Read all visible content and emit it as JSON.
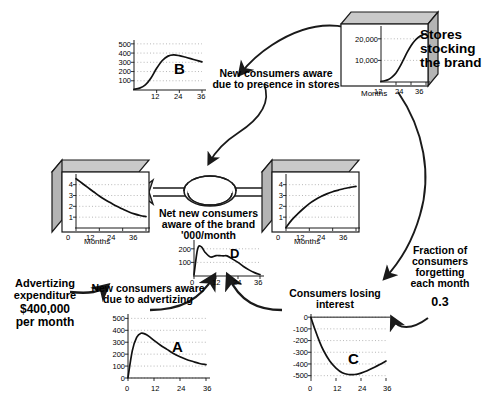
{
  "diagram": {
    "labels": {
      "stores_stocking": "Stores\nstocking\nthe brand",
      "new_aware_stores": "New consumers aware\ndue to presence in stores",
      "net_new_consumers": "Net new consumers\naware of the brand\n'000/month",
      "new_aware_advertizing": "New consumers aware\ndue to advertizing",
      "consumers_losing_interest": "Consumers losing\ninterest",
      "advertizing_expenditure": "Advertizing\nexpenditure",
      "advertizing_amount": "$400,000\nper month",
      "forgetting_fraction": "Fraction of\nconsumers\nforgetting\neach month",
      "forgetting_value": "0.3"
    },
    "chart_letters": {
      "a": "A",
      "b": "B",
      "c": "C",
      "d": "D"
    },
    "axis_title": "Months"
  },
  "chart_data": [
    {
      "id": "stores",
      "type": "line",
      "title": "Stores stocking the brand",
      "xlabel": "Months",
      "ylabel": "",
      "xticks": [
        12,
        24,
        36
      ],
      "yticks": [
        10000,
        20000
      ],
      "ytick_labels": [
        "10,000",
        "20,000"
      ],
      "xlim": [
        0,
        36
      ],
      "ylim": [
        0,
        25000
      ],
      "grid": true,
      "x": [
        0,
        3,
        6,
        9,
        12,
        15,
        18,
        21,
        24,
        27,
        30,
        33,
        36
      ],
      "values": [
        300,
        600,
        1200,
        2400,
        4200,
        7000,
        10400,
        13800,
        16800,
        19100,
        20700,
        21700,
        22300
      ]
    },
    {
      "id": "b",
      "type": "line",
      "title": "New consumers aware due to presence in stores",
      "label": "B",
      "xlabel": "Months",
      "ylabel": "",
      "xticks": [
        12,
        24,
        36
      ],
      "yticks": [
        100,
        200,
        300,
        400,
        500
      ],
      "ytick_labels": [
        "100",
        "200",
        "300",
        "400",
        "500"
      ],
      "xlim": [
        0,
        36
      ],
      "ylim": [
        0,
        520
      ],
      "grid": true,
      "x": [
        0,
        3,
        6,
        9,
        12,
        15,
        18,
        21,
        24,
        27,
        30,
        33,
        36
      ],
      "values": [
        8,
        20,
        55,
        130,
        235,
        320,
        367,
        380,
        372,
        357,
        340,
        322,
        305
      ]
    },
    {
      "id": "left_stock",
      "type": "line",
      "title": "Consumers not aware of the brand",
      "xlabel": "Months",
      "ylabel": "",
      "xticks": [
        0,
        12,
        24,
        36
      ],
      "yticks": [
        1,
        2,
        3,
        4
      ],
      "ytick_labels": [
        "1",
        "2",
        "3",
        "4"
      ],
      "xlim": [
        0,
        36
      ],
      "ylim": [
        0,
        4.8
      ],
      "grid": true,
      "x": [
        0,
        3,
        6,
        9,
        12,
        15,
        18,
        21,
        24,
        27,
        30,
        33,
        36
      ],
      "values": [
        4.55,
        4.15,
        3.75,
        3.35,
        2.95,
        2.6,
        2.3,
        2.0,
        1.75,
        1.5,
        1.3,
        1.15,
        1.05
      ]
    },
    {
      "id": "right_stock",
      "type": "line",
      "title": "Consumers aware of the brand",
      "xlabel": "Months",
      "ylabel": "",
      "xticks": [
        0,
        12,
        24,
        36
      ],
      "yticks": [
        1,
        2,
        3,
        4
      ],
      "ytick_labels": [
        "1",
        "2",
        "3",
        "4"
      ],
      "xlim": [
        0,
        36
      ],
      "ylim": [
        0,
        4.8
      ],
      "grid": true,
      "x": [
        0,
        3,
        6,
        9,
        12,
        15,
        18,
        21,
        24,
        27,
        30,
        33,
        36
      ],
      "values": [
        0.05,
        0.75,
        1.3,
        1.8,
        2.25,
        2.6,
        2.9,
        3.15,
        3.35,
        3.5,
        3.65,
        3.75,
        3.85
      ]
    },
    {
      "id": "d",
      "type": "line",
      "title": "Net new consumers aware of the brand '000/month",
      "label": "D",
      "xlabel": "Months",
      "ylabel": "",
      "xticks": [
        0,
        12,
        24,
        36
      ],
      "yticks": [
        100,
        200
      ],
      "ytick_labels": [
        "100",
        "200"
      ],
      "xlim": [
        0,
        36
      ],
      "ylim": [
        0,
        250
      ],
      "grid": true,
      "x": [
        0,
        2,
        4,
        6,
        9,
        12,
        14,
        16,
        18,
        21,
        24,
        27,
        30,
        33,
        36
      ],
      "values": [
        10,
        200,
        215,
        175,
        140,
        150,
        150,
        148,
        148,
        125,
        100,
        70,
        45,
        25,
        10
      ]
    },
    {
      "id": "a",
      "type": "line",
      "title": "New consumers aware due to advertizing",
      "label": "A",
      "xlabel": "Months",
      "ylabel": "",
      "xticks": [
        0,
        12,
        24,
        36
      ],
      "yticks": [
        0,
        100,
        200,
        300,
        400,
        500
      ],
      "ytick_labels": [
        "0",
        "100",
        "200",
        "300",
        "400",
        "500"
      ],
      "xlim": [
        0,
        36
      ],
      "ylim": [
        0,
        520
      ],
      "grid": true,
      "x": [
        0,
        2,
        4,
        6,
        8,
        10,
        12,
        15,
        18,
        21,
        24,
        27,
        30,
        33,
        36
      ],
      "values": [
        5,
        230,
        340,
        375,
        368,
        345,
        315,
        275,
        240,
        205,
        178,
        155,
        138,
        122,
        112
      ]
    },
    {
      "id": "c",
      "type": "line",
      "title": "Consumers losing interest",
      "label": "C",
      "xlabel": "Months",
      "ylabel": "",
      "xticks": [
        0,
        12,
        24,
        36
      ],
      "yticks": [
        0,
        -100,
        -200,
        -300,
        -400,
        -500
      ],
      "ytick_labels": [
        "0",
        "-100",
        "-200",
        "-300",
        "-400",
        "-500"
      ],
      "xlim": [
        0,
        36
      ],
      "ylim": [
        -520,
        10
      ],
      "grid": true,
      "x": [
        0,
        2,
        4,
        6,
        9,
        12,
        15,
        18,
        21,
        24,
        27,
        30,
        33,
        36
      ],
      "values": [
        -5,
        -110,
        -205,
        -285,
        -375,
        -435,
        -475,
        -490,
        -490,
        -478,
        -458,
        -432,
        -405,
        -375
      ]
    }
  ],
  "colors": {
    "ink": "#000000",
    "box_top": "#c9c9c9",
    "box_side": "#b4b4b4",
    "grid": "#9a9a9a",
    "pipe_fill": "#cfcfcf"
  }
}
